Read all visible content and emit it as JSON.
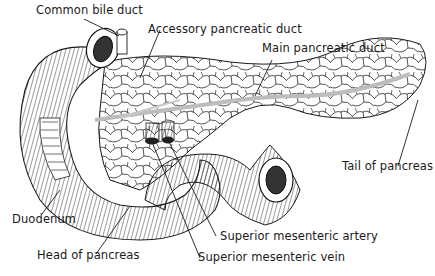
{
  "diagram": {
    "colors": {
      "ink": "#1a1a1a",
      "duct": "#bdbdbd",
      "background": "#ffffff"
    },
    "labels": [
      {
        "id": "common-bile-duct",
        "text": "Common bile duct"
      },
      {
        "id": "accessory-pancreatic-duct",
        "text": "Accessory pancreatic duct"
      },
      {
        "id": "main-pancreatic-duct",
        "text": "Main pancreatic duct"
      },
      {
        "id": "tail-of-pancreas",
        "text": "Tail of pancreas"
      },
      {
        "id": "duodenum",
        "text": "Duodenum"
      },
      {
        "id": "head-of-pancreas",
        "text": "Head of pancreas"
      },
      {
        "id": "superior-mesenteric-artery",
        "text": "Superior mesenteric artery"
      },
      {
        "id": "superior-mesenteric-vein",
        "text": "Superior mesenteric vein"
      }
    ]
  }
}
